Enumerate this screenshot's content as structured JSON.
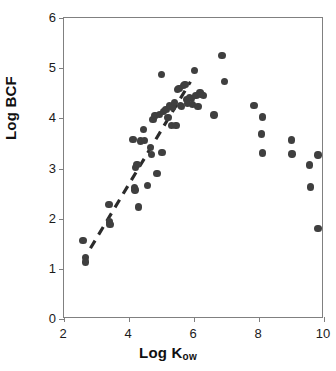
{
  "chart_data": {
    "type": "scatter",
    "title": "",
    "xlabel": "Log K",
    "xlabel_sub": "ow",
    "ylabel": "Log BCF",
    "xlim": [
      2,
      10
    ],
    "ylim": [
      0,
      6
    ],
    "xticks": [
      2,
      4,
      6,
      8,
      10
    ],
    "yticks": [
      0,
      1,
      2,
      3,
      4,
      5,
      6
    ],
    "grid": false,
    "legend": false,
    "marker_color": "#3f3f3f",
    "axis_color": "#808080",
    "trendline": {
      "style": "dashed",
      "color": "#2b2b2b",
      "x_start": 2.82,
      "y_start": 1.38,
      "x_end": 5.92,
      "y_end": 4.72
    },
    "points": [
      [
        2.58,
        1.57
      ],
      [
        2.66,
        1.22
      ],
      [
        2.66,
        1.14
      ],
      [
        3.38,
        2.28
      ],
      [
        3.4,
        1.93
      ],
      [
        3.42,
        1.88
      ],
      [
        4.12,
        3.58
      ],
      [
        4.16,
        2.62
      ],
      [
        4.18,
        2.57
      ],
      [
        4.2,
        3.02
      ],
      [
        4.24,
        3.08
      ],
      [
        4.3,
        2.23
      ],
      [
        4.36,
        3.55
      ],
      [
        4.44,
        3.78
      ],
      [
        4.48,
        3.56
      ],
      [
        4.56,
        2.66
      ],
      [
        4.66,
        3.42
      ],
      [
        4.7,
        3.28
      ],
      [
        4.74,
        3.98
      ],
      [
        4.8,
        4.06
      ],
      [
        4.86,
        2.9
      ],
      [
        4.94,
        4.08
      ],
      [
        5.0,
        4.87
      ],
      [
        5.02,
        3.32
      ],
      [
        5.06,
        4.14
      ],
      [
        5.14,
        4.18
      ],
      [
        5.2,
        4.02
      ],
      [
        5.24,
        4.26
      ],
      [
        5.3,
        3.86
      ],
      [
        5.34,
        4.22
      ],
      [
        5.4,
        4.32
      ],
      [
        5.44,
        3.86
      ],
      [
        5.5,
        4.58
      ],
      [
        5.54,
        4.6
      ],
      [
        5.58,
        4.26
      ],
      [
        5.62,
        4.24
      ],
      [
        5.68,
        4.66
      ],
      [
        5.72,
        4.68
      ],
      [
        5.76,
        4.38
      ],
      [
        5.8,
        4.3
      ],
      [
        5.86,
        4.42
      ],
      [
        5.92,
        4.4
      ],
      [
        5.96,
        4.28
      ],
      [
        6.02,
        4.95
      ],
      [
        6.06,
        4.46
      ],
      [
        6.12,
        4.24
      ],
      [
        6.18,
        4.52
      ],
      [
        6.22,
        4.48
      ],
      [
        6.3,
        4.46
      ],
      [
        6.62,
        4.07
      ],
      [
        6.86,
        5.25
      ],
      [
        6.94,
        4.74
      ],
      [
        7.84,
        4.26
      ],
      [
        8.1,
        4.03
      ],
      [
        8.08,
        3.69
      ],
      [
        8.1,
        3.31
      ],
      [
        9.0,
        3.57
      ],
      [
        9.02,
        3.29
      ],
      [
        9.56,
        3.07
      ],
      [
        9.58,
        2.63
      ],
      [
        9.82,
        3.27
      ],
      [
        9.82,
        1.8
      ]
    ]
  }
}
